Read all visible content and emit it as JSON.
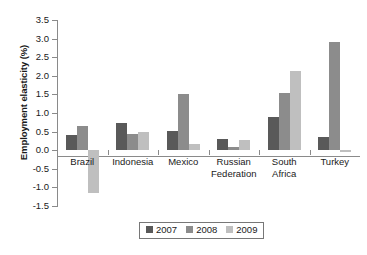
{
  "chart_data": {
    "type": "bar",
    "title": "",
    "xlabel": "",
    "ylabel": "Employment elasticity (%)",
    "ylim": [
      -1.5,
      3.5
    ],
    "ytick_step": 0.5,
    "grid": false,
    "legend_position": "bottom-center",
    "categories": [
      "Brazil",
      "Indonesia",
      "Mexico",
      "Russian Federation",
      "South Africa",
      "Turkey"
    ],
    "category_lines": [
      [
        "Brazil"
      ],
      [
        "Indonesia"
      ],
      [
        "Mexico"
      ],
      [
        "Russian",
        "Federation"
      ],
      [
        "South",
        "Africa"
      ],
      [
        "Turkey"
      ]
    ],
    "ytick_labels": [
      "3.5",
      "3.0",
      "2.5",
      "2.0",
      "1.5",
      "1.0",
      "0.5",
      "0.0",
      "-0.5",
      "-1.0",
      "-1.5"
    ],
    "ytick_values": [
      3.5,
      3.0,
      2.5,
      2.0,
      1.5,
      1.0,
      0.5,
      0.0,
      -0.5,
      -1.0,
      -1.5
    ],
    "series": [
      {
        "name": "2007",
        "color": "#595959",
        "values": [
          0.42,
          0.74,
          0.52,
          0.29,
          0.88,
          0.36
        ]
      },
      {
        "name": "2008",
        "color": "#8c8c8c",
        "values": [
          0.64,
          0.43,
          1.51,
          0.09,
          1.53,
          2.92
        ]
      },
      {
        "name": "2009",
        "color": "#bfbfbf",
        "values": [
          -1.15,
          0.48,
          0.18,
          0.28,
          2.14,
          -0.05
        ]
      }
    ]
  },
  "legend": {
    "entries": [
      {
        "label": "2007",
        "color": "#595959"
      },
      {
        "label": "2008",
        "color": "#8c8c8c"
      },
      {
        "label": "2009",
        "color": "#bfbfbf"
      }
    ]
  }
}
